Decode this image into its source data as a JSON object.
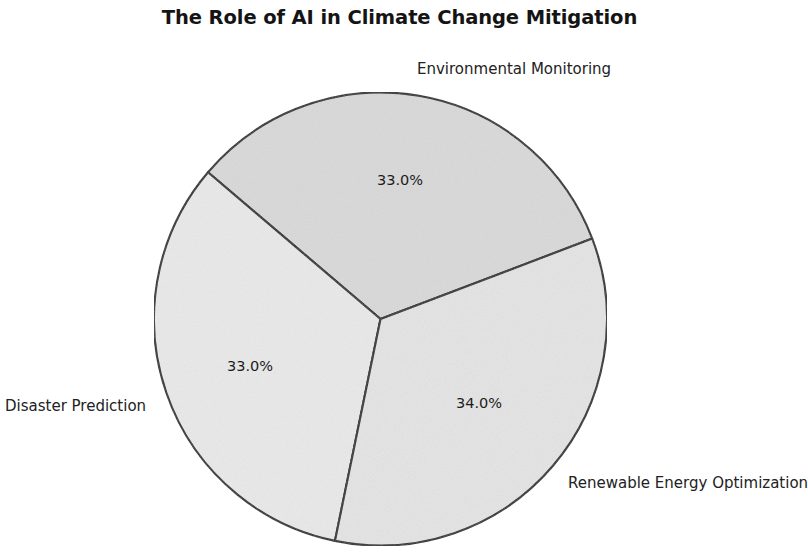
{
  "chart_data": {
    "type": "pie",
    "title": "The Role of AI in Climate Change Mitigation",
    "categories": [
      "Environmental Monitoring",
      "Disaster Prediction",
      "Renewable Energy Optimization"
    ],
    "values": [
      33.0,
      33.0,
      34.0
    ],
    "value_labels": [
      "33.0%",
      "33.0%",
      "34.0%"
    ],
    "slice_colors": [
      "#d9d9d9",
      "#e9e9e9",
      "#e4e4e4"
    ],
    "edge_color": "#2b2b2b",
    "legend": "none",
    "grid": false,
    "xlabel": "",
    "ylabel": "",
    "start_angle_deg": 20.8,
    "direction": "counterclockwise",
    "background": "#ffffff"
  }
}
